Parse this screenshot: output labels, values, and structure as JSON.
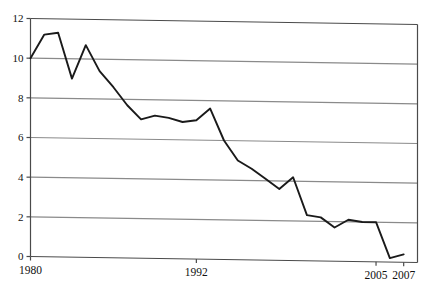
{
  "figure": {
    "top_partial_caption": "",
    "background_color": "#ffffff",
    "line_color": "#1a1a1a",
    "grid_color": "#8a8a8a",
    "frame_color": "#4a4a4a"
  },
  "chart_data": {
    "type": "line",
    "title": "",
    "subtitle": "",
    "xlabel": "",
    "ylabel": "",
    "xlim": [
      1980,
      2008
    ],
    "ylim": [
      0,
      12
    ],
    "grid": true,
    "grid_axis": "y",
    "legend": false,
    "legend_position": "none",
    "y_ticks": [
      0,
      2,
      4,
      6,
      8,
      10,
      12
    ],
    "y_tick_labels": [
      "0",
      "2",
      "4",
      "6",
      "8",
      "10",
      "12"
    ],
    "x_ticks": [
      1980,
      1992,
      2005,
      2007
    ],
    "x_tick_labels": [
      "1980",
      "1992",
      "2005",
      "2007"
    ],
    "series": [
      {
        "name": "series-1",
        "color": "#1a1a1a",
        "x": [
          1980,
          1981,
          1982,
          1983,
          1984,
          1985,
          1986,
          1987,
          1988,
          1989,
          1990,
          1991,
          1992,
          1993,
          1994,
          1995,
          1996,
          1997,
          1998,
          1999,
          2000,
          2001,
          2002,
          2003,
          2004,
          2005,
          2006,
          2007
        ],
        "values": [
          10.0,
          11.2,
          11.3,
          9.0,
          10.7,
          9.4,
          8.6,
          7.7,
          7.0,
          7.2,
          7.1,
          6.9,
          7.0,
          7.6,
          6.0,
          5.0,
          4.6,
          4.1,
          3.6,
          4.2,
          2.3,
          2.2,
          1.7,
          2.1,
          2.0,
          2.0,
          0.2,
          0.4
        ]
      }
    ]
  }
}
